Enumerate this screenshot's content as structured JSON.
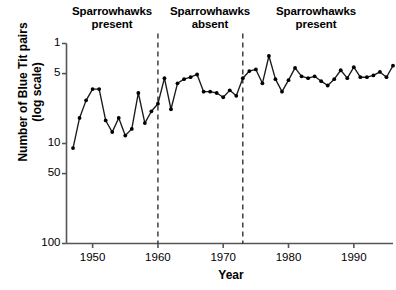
{
  "figure": {
    "background_color": "#ffffff",
    "line_color": "#1a1a1a",
    "marker_color": "#000000",
    "axis_color": "#555555",
    "divider_color": "#222222"
  },
  "annotations": [
    {
      "id": "present-1",
      "line1": "Sparrowhawks",
      "line2": "present"
    },
    {
      "id": "absent",
      "line1": "Sparrowhawks",
      "line2": "absent"
    },
    {
      "id": "present-2",
      "line1": "Sparrowhawks",
      "line2": "present"
    }
  ],
  "axis_titles": {
    "y_line1": "Number of Blue Tit pairs",
    "y_line2": "(log scale)",
    "x": "Year"
  },
  "ytick_labels": [
    "100",
    "50",
    "10",
    "5",
    "1"
  ],
  "xtick_labels": [
    "1950",
    "1960",
    "1970",
    "1980",
    "1990"
  ],
  "chart_data": {
    "type": "line",
    "title": "",
    "subtitle": "",
    "xlabel": "Year",
    "ylabel": "Number of Blue Tit pairs (log scale)",
    "yscale": "log",
    "ylim": [
      1,
      100
    ],
    "xlim": [
      1946,
      1996
    ],
    "yticks": [
      1,
      5,
      10,
      50,
      100
    ],
    "xticks": [
      1950,
      1960,
      1970,
      1980,
      1990
    ],
    "grid": false,
    "legend": "none",
    "marker": "filled-circle",
    "annotations": [
      {
        "text": "Sparrowhawks present",
        "x_range": [
          1946,
          1960
        ]
      },
      {
        "text": "Sparrowhawks absent",
        "x_range": [
          1960,
          1973
        ]
      },
      {
        "text": "Sparrowhawks present",
        "x_range": [
          1973,
          1996
        ]
      }
    ],
    "vlines": [
      {
        "x": 1960,
        "style": "dashed"
      },
      {
        "x": 1973,
        "style": "dashed"
      }
    ],
    "x": [
      1947,
      1948,
      1949,
      1950,
      1951,
      1952,
      1953,
      1954,
      1955,
      1956,
      1957,
      1958,
      1959,
      1960,
      1961,
      1962,
      1963,
      1964,
      1965,
      1966,
      1967,
      1968,
      1969,
      1970,
      1971,
      1972,
      1973,
      1974,
      1975,
      1976,
      1977,
      1978,
      1979,
      1980,
      1981,
      1982,
      1983,
      1984,
      1985,
      1986,
      1987,
      1988,
      1989,
      1990,
      1991,
      1992,
      1993,
      1994,
      1995,
      1996
    ],
    "values": [
      9,
      18,
      27,
      35,
      35,
      17,
      13,
      18,
      12,
      14,
      32,
      16,
      21,
      25,
      45,
      22,
      40,
      44,
      46,
      49,
      33,
      33,
      32,
      29,
      34,
      30,
      45,
      53,
      55,
      40,
      75,
      44,
      33,
      43,
      57,
      47,
      45,
      47,
      42,
      38,
      44,
      54,
      45,
      58,
      46,
      46,
      48,
      52,
      46,
      60
    ],
    "series": [
      {
        "name": "Blue Tit pairs",
        "values": [
          9,
          18,
          27,
          35,
          35,
          17,
          13,
          18,
          12,
          14,
          32,
          16,
          21,
          25,
          45,
          22,
          40,
          44,
          46,
          49,
          33,
          33,
          32,
          29,
          34,
          30,
          45,
          53,
          55,
          40,
          75,
          44,
          33,
          43,
          57,
          47,
          45,
          47,
          42,
          38,
          44,
          54,
          45,
          58,
          46,
          46,
          48,
          52,
          46,
          60
        ]
      }
    ]
  }
}
